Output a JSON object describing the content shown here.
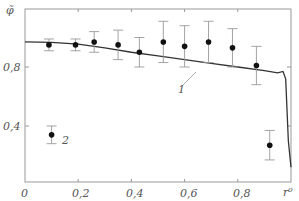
{
  "chart_data": {
    "type": "scatter",
    "title": "",
    "xlabel": "r⁰",
    "ylabel": "φ̃",
    "xlim": [
      0,
      1.0
    ],
    "ylim": [
      0.12,
      1.0
    ],
    "x_ticks": [
      "0",
      "0,2",
      "0,4",
      "0,6",
      "0,8",
      "r⁰"
    ],
    "y_ticks": [
      "0,4",
      "0,8"
    ],
    "grid": false,
    "series": [
      {
        "name": "1",
        "kind": "line",
        "x": [
          0,
          0.1,
          0.2,
          0.3,
          0.4,
          0.5,
          0.6,
          0.7,
          0.8,
          0.9,
          0.95,
          0.97,
          0.98,
          0.99,
          1.0
        ],
        "y": [
          0.97,
          0.967,
          0.955,
          0.93,
          0.9,
          0.875,
          0.85,
          0.825,
          0.8,
          0.775,
          0.76,
          0.77,
          0.72,
          0.3,
          0.12
        ]
      },
      {
        "name": "2",
        "kind": "points_with_errorbars",
        "x": [
          0.09,
          0.19,
          0.26,
          0.35,
          0.43,
          0.52,
          0.6,
          0.69,
          0.78,
          0.87,
          0.92
        ],
        "y": [
          0.95,
          0.95,
          0.97,
          0.95,
          0.9,
          0.97,
          0.94,
          0.97,
          0.93,
          0.81,
          0.27
        ],
        "err": [
          0.04,
          0.04,
          0.07,
          0.1,
          0.1,
          0.14,
          0.14,
          0.14,
          0.13,
          0.13,
          0.1
        ]
      },
      {
        "name": "2-label-point",
        "kind": "points_with_errorbars",
        "x": [
          0.1
        ],
        "y": [
          0.34
        ],
        "err": [
          0.06
        ]
      }
    ],
    "annotations": [
      {
        "text": "1",
        "target": "line"
      },
      {
        "text": "2",
        "target": "points"
      }
    ]
  },
  "labels": {
    "ylabel": "φ̃",
    "xlabel": "r⁰",
    "tick_0": "0",
    "tick_02": "0,2",
    "tick_04": "0,4",
    "tick_06": "0,6",
    "tick_08": "0,8",
    "ytick_04": "0,4",
    "ytick_08": "0,8",
    "curve_label": "1",
    "points_label": "2"
  }
}
